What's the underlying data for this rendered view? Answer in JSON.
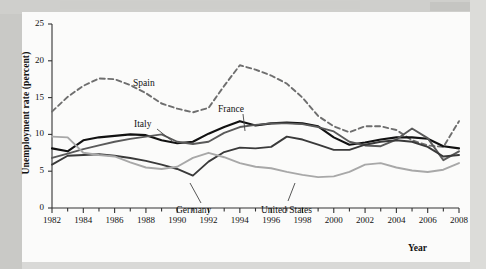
{
  "chart_data": {
    "type": "line",
    "title": "",
    "xlabel": "Year",
    "ylabel": "Unemployment rate (percent)",
    "xlim": [
      1982,
      2008
    ],
    "ylim": [
      0,
      25
    ],
    "yticks": [
      0,
      5,
      10,
      15,
      20,
      25
    ],
    "xticks": [
      1982,
      1984,
      1986,
      1988,
      1990,
      1992,
      1994,
      1996,
      1998,
      2000,
      2002,
      2004,
      2006,
      2008
    ],
    "xtick_labels": [
      "1982",
      "1984",
      "1986",
      "1988",
      "1990",
      "1992",
      "1994",
      "1996",
      "1998",
      "2000",
      "2002",
      "2004",
      "2006",
      "2008"
    ],
    "ytick_labels": [
      "0",
      "5",
      "10",
      "15",
      "20",
      "25"
    ],
    "minor_xticks_every": 1,
    "grid": false,
    "legend_position": "inline-annotations",
    "x": [
      1982,
      1983,
      1984,
      1985,
      1986,
      1987,
      1988,
      1989,
      1990,
      1991,
      1992,
      1993,
      1994,
      1995,
      1996,
      1997,
      1998,
      1999,
      2000,
      2001,
      2002,
      2003,
      2004,
      2005,
      2006,
      2007,
      2008
    ],
    "series": [
      {
        "name": "Spain",
        "style": "dashed",
        "color": "#6e6e6e",
        "values": [
          13.1,
          15.1,
          16.6,
          17.6,
          17.5,
          16.7,
          15.6,
          14.2,
          13.5,
          13.0,
          13.6,
          16.6,
          19.4,
          18.8,
          18.0,
          16.9,
          15.0,
          12.5,
          11.1,
          10.3,
          11.1,
          11.1,
          10.6,
          9.2,
          8.5,
          8.3,
          11.8
        ]
      },
      {
        "name": "France",
        "style": "solid",
        "color": "#111111",
        "values": [
          8.1,
          7.7,
          9.2,
          9.6,
          9.8,
          10.0,
          9.9,
          9.2,
          8.8,
          9.0,
          10.1,
          11.0,
          11.8,
          11.2,
          11.5,
          11.6,
          11.5,
          11.1,
          9.6,
          8.6,
          8.9,
          9.3,
          9.6,
          9.6,
          9.4,
          8.4,
          8.1
        ]
      },
      {
        "name": "Italy",
        "style": "solid",
        "color": "#5a5a5a",
        "values": [
          6.8,
          7.4,
          8.0,
          8.5,
          9.0,
          9.4,
          9.7,
          10.0,
          9.0,
          8.7,
          9.0,
          10.2,
          11.0,
          11.3,
          11.5,
          11.5,
          11.4,
          11.0,
          10.4,
          9.0,
          8.5,
          8.4,
          9.3,
          10.8,
          9.5,
          6.5,
          7.7
        ]
      },
      {
        "name": "Germany",
        "style": "solid",
        "color": "#3a3a3a",
        "values": [
          5.9,
          7.1,
          7.2,
          7.3,
          7.1,
          6.8,
          6.4,
          5.9,
          5.3,
          4.4,
          6.3,
          7.6,
          8.2,
          8.1,
          8.3,
          9.7,
          9.3,
          8.6,
          7.9,
          7.9,
          8.6,
          9.0,
          9.2,
          9.0,
          8.3,
          7.0,
          7.2
        ]
      },
      {
        "name": "United States",
        "style": "solid",
        "color": "#a8a8a8",
        "values": [
          9.7,
          9.6,
          7.5,
          7.2,
          7.0,
          6.2,
          5.5,
          5.3,
          5.6,
          6.8,
          7.5,
          6.9,
          6.1,
          5.6,
          5.4,
          4.9,
          4.5,
          4.2,
          4.3,
          4.9,
          5.9,
          6.1,
          5.5,
          5.1,
          4.9,
          5.2,
          6.1
        ]
      }
    ],
    "annotations": [
      {
        "label": "Spain",
        "series": "Spain"
      },
      {
        "label": "France",
        "series": "France"
      },
      {
        "label": "Italy",
        "series": "Italy"
      },
      {
        "label": "Germany",
        "series": "Germany"
      },
      {
        "label": "United States",
        "series": "United States"
      }
    ]
  }
}
